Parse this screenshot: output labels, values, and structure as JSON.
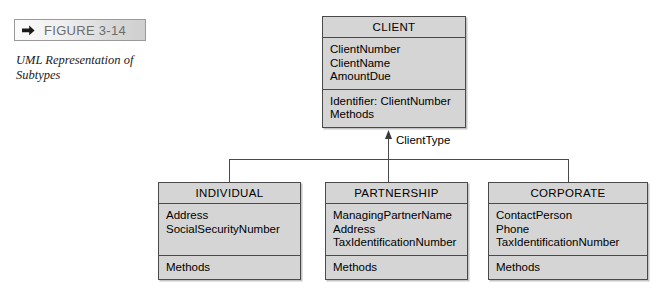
{
  "figure": {
    "label": "FIGURE 3-14",
    "arrow_icon": "triangle-right-icon",
    "caption": "UML Representation of Subtypes"
  },
  "diagram": {
    "discriminator_label": "ClientType",
    "arrowhead_icon": "generalization-triangle-icon",
    "supertype": {
      "name": "CLIENT",
      "attributes": [
        "ClientNumber",
        "ClientName",
        "AmountDue"
      ],
      "operations": [
        "Identifier: ClientNumber",
        "Methods"
      ]
    },
    "subtypes": [
      {
        "name": "INDIVIDUAL",
        "attributes": [
          "Address",
          "SocialSecurityNumber"
        ],
        "operations": [
          "Methods"
        ]
      },
      {
        "name": "PARTNERSHIP",
        "attributes": [
          "ManagingPartnerName",
          "Address",
          "TaxIdentificationNumber"
        ],
        "operations": [
          "Methods"
        ]
      },
      {
        "name": "CORPORATE",
        "attributes": [
          "ContactPerson",
          "Phone",
          "TaxIdentificationNumber"
        ],
        "operations": [
          "Methods"
        ]
      }
    ]
  },
  "colors": {
    "box_fill": "#d5d5d5",
    "box_border": "#4a4a4a",
    "label_text": "#6c6c6c",
    "page_background": "#ffffff"
  }
}
